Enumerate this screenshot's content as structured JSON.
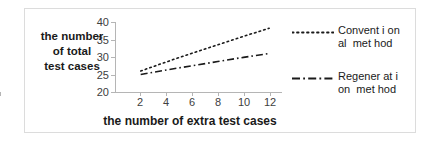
{
  "chart_data": {
    "type": "line",
    "title": "",
    "xlabel": "the number of extra test cases",
    "ylabel": "the number of total test cases",
    "xlim": [
      0,
      13
    ],
    "ylim": [
      20,
      40
    ],
    "xticks": [
      "2",
      "4",
      "6",
      "8",
      "10",
      "12"
    ],
    "yticks": [
      "40",
      "35",
      "30",
      "25",
      "20"
    ],
    "grid": false,
    "legend_position": "right",
    "x": [
      2,
      4,
      6,
      8,
      10,
      12
    ],
    "series": [
      {
        "name": "Convent i on\nal  met hod",
        "style": "dotted",
        "color": "#1a1a1a",
        "values": [
          26.0,
          28.6,
          31.1,
          33.5,
          35.9,
          38.2
        ]
      },
      {
        "name": "Regener at i\non  met hod",
        "style": "dash-dot",
        "color": "#1a1a1a",
        "values": [
          25.0,
          26.3,
          27.5,
          28.7,
          29.9,
          31.0
        ]
      }
    ]
  },
  "figure": {
    "ytitle_lines": [
      "the number",
      "of total",
      "test cases"
    ],
    "xtitle": "the number of extra test cases"
  },
  "legend": {
    "items": [
      {
        "label": "Convent i on\nal  met hod",
        "style": "dotted"
      },
      {
        "label": "Regener at i\non  met hod",
        "style": "dash-dot"
      }
    ]
  }
}
